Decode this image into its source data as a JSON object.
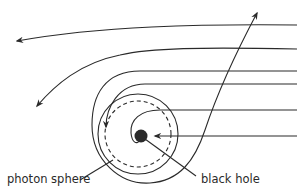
{
  "diagram": {
    "labels": {
      "photon_sphere": "photon sphere",
      "black_hole": "black hole"
    },
    "colors": {
      "stroke": "#2a2a2a",
      "background": "#ffffff"
    },
    "elements": [
      {
        "id": "ray-1",
        "type": "light-ray",
        "behavior": "slightly deflected, escapes left"
      },
      {
        "id": "ray-2",
        "type": "light-ray",
        "behavior": "strongly deflected, escapes lower-left"
      },
      {
        "id": "ray-3",
        "type": "light-ray",
        "behavior": "loops around, escapes upward"
      },
      {
        "id": "ray-4",
        "type": "light-ray",
        "behavior": "orbits near photon sphere"
      },
      {
        "id": "ray-5",
        "type": "light-ray",
        "behavior": "spirals into black hole"
      },
      {
        "id": "ray-6",
        "type": "light-ray",
        "behavior": "falls straight into black hole"
      },
      {
        "id": "photon-sphere",
        "type": "dashed-circle"
      },
      {
        "id": "black-hole",
        "type": "filled-disc"
      }
    ]
  }
}
